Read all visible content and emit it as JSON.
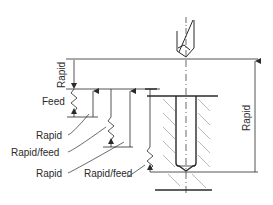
{
  "diagram": {
    "type": "drilling-cycle",
    "labels": {
      "rapid_top_left": "Rapid",
      "feed": "Feed",
      "rapid_1": "Rapid",
      "rapid_feed_1": "Rapid/feed",
      "rapid_2": "Rapid",
      "rapid_feed_2": "Rapid/feed",
      "rapid_right": "Rapid"
    },
    "colors": {
      "line": "#2a2a2a",
      "hatch": "#8a8a8a",
      "background": "#ffffff"
    }
  }
}
